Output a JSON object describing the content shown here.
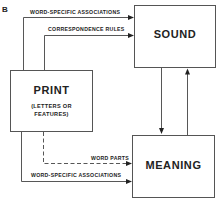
{
  "panel_label": "B",
  "nodes": {
    "print": {
      "title": "PRINT",
      "subtitle_line1": "(LETTERS OR",
      "subtitle_line2": "FEATURES)"
    },
    "sound": {
      "title": "SOUND"
    },
    "meaning": {
      "title": "MEANING"
    }
  },
  "edges": {
    "print_to_sound_word_specific": {
      "label": "WORD-SPECIFIC ASSOCIATIONS",
      "style": "solid"
    },
    "print_to_sound_correspondence": {
      "label": "CORRESPONDENCE RULES",
      "style": "solid"
    },
    "print_to_meaning_word_parts": {
      "label": "WORD PARTS",
      "style": "dashed"
    },
    "print_to_meaning_word_specific": {
      "label": "WORD-SPECIFIC ASSOCIATIONS",
      "style": "solid"
    },
    "sound_to_meaning": {
      "label": "",
      "style": "solid"
    },
    "meaning_to_sound": {
      "label": "",
      "style": "solid"
    }
  }
}
